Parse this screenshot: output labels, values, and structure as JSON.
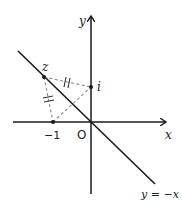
{
  "diagram": {
    "type": "complex-plane",
    "axes": {
      "x_label": "x",
      "y_label": "y",
      "origin_label": "O"
    },
    "line": {
      "equation_label": "y = −x"
    },
    "points": [
      {
        "name": "z",
        "label": "z"
      },
      {
        "name": "i",
        "label": "i"
      },
      {
        "name": "minus-one",
        "label": "−1"
      }
    ],
    "equal_segments": [
      {
        "from": "z",
        "to": "i",
        "tick_marks": 2
      },
      {
        "from": "z",
        "to": "minus-one",
        "tick_marks": 2
      }
    ],
    "extra_segments": [
      {
        "from": "minus-one",
        "to": "i",
        "style": "dashed"
      }
    ],
    "colors": {
      "axis": "#1a1a1a",
      "dashed": "#888888",
      "text": "#222222"
    }
  }
}
